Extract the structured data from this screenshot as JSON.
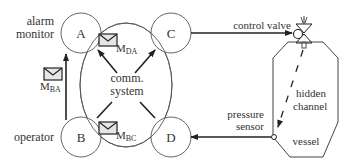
{
  "diagram": {
    "nodes": {
      "A": {
        "label": "A",
        "role": "alarm monitor"
      },
      "B": {
        "label": "B",
        "role": "operator"
      },
      "C": {
        "label": "C",
        "role": "control valve"
      },
      "D": {
        "label": "D",
        "role": "pressure sensor"
      }
    },
    "labels": {
      "alarm_monitor_line1": "alarm",
      "alarm_monitor_line2": "monitor",
      "operator": "operator",
      "comm_line1": "comm.",
      "comm_line2": "system",
      "control_valve": "control valve",
      "pressure_line1": "pressure",
      "pressure_line2": "sensor",
      "hidden_line1": "hidden",
      "hidden_line2": "channel",
      "vessel": "vessel"
    },
    "messages": {
      "m_ba": {
        "main": "M",
        "sub": "BA"
      },
      "m_da": {
        "main": "M",
        "sub": "DA"
      },
      "m_bc": {
        "main": "M",
        "sub": "BC"
      }
    },
    "colors": {
      "line": "#222222",
      "text": "#333333",
      "envelope_fill": "#e6e6e6"
    }
  }
}
